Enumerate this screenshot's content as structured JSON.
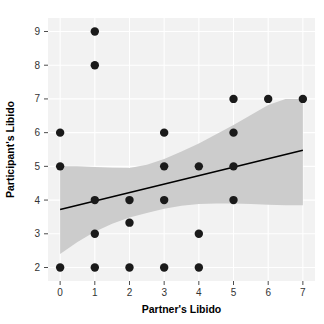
{
  "chart_data": {
    "type": "scatter",
    "title": "",
    "xlabel": "Partner's Libido",
    "ylabel": "Participant's Libido",
    "xlim": [
      -0.35,
      7.35
    ],
    "ylim": [
      1.6,
      9.4
    ],
    "xticks": [
      0,
      1,
      2,
      3,
      4,
      5,
      6,
      7
    ],
    "xticklabels": [
      "0",
      "1",
      "2",
      "3",
      "4",
      "5",
      "6",
      "7"
    ],
    "yticks": [
      2,
      3,
      4,
      5,
      6,
      7,
      8,
      9
    ],
    "yticklabels": [
      "2",
      "3",
      "4",
      "5",
      "6",
      "7",
      "8",
      "9"
    ],
    "grid": true,
    "legend": "none",
    "points": [
      {
        "x": 0,
        "y": 6
      },
      {
        "x": 0,
        "y": 5
      },
      {
        "x": 0,
        "y": 2
      },
      {
        "x": 1,
        "y": 9
      },
      {
        "x": 1,
        "y": 8
      },
      {
        "x": 1,
        "y": 4
      },
      {
        "x": 1,
        "y": 3
      },
      {
        "x": 1,
        "y": 2
      },
      {
        "x": 2,
        "y": 4
      },
      {
        "x": 2,
        "y": 3.33
      },
      {
        "x": 2,
        "y": 2
      },
      {
        "x": 3,
        "y": 6
      },
      {
        "x": 3,
        "y": 5
      },
      {
        "x": 3,
        "y": 4
      },
      {
        "x": 3,
        "y": 2
      },
      {
        "x": 4,
        "y": 5
      },
      {
        "x": 4,
        "y": 3
      },
      {
        "x": 4,
        "y": 2
      },
      {
        "x": 5,
        "y": 7
      },
      {
        "x": 5,
        "y": 6
      },
      {
        "x": 5,
        "y": 5
      },
      {
        "x": 5,
        "y": 4
      },
      {
        "x": 6,
        "y": 7
      },
      {
        "x": 7,
        "y": 7
      }
    ],
    "regression_line": {
      "x": [
        0,
        7
      ],
      "y": [
        3.72,
        5.48
      ]
    },
    "confidence_band": {
      "x": [
        0,
        0.5,
        1.0,
        1.5,
        2.0,
        2.5,
        3.0,
        3.5,
        4.0,
        4.5,
        5.0,
        5.5,
        6.0,
        6.5,
        7.0
      ],
      "upper": [
        5.0,
        5.0,
        4.98,
        4.96,
        4.95,
        5.05,
        5.22,
        5.44,
        5.68,
        5.95,
        6.23,
        6.52,
        6.82,
        7.0,
        7.0
      ],
      "lower": [
        2.4,
        2.76,
        3.06,
        3.3,
        3.48,
        3.62,
        3.74,
        3.83,
        3.88,
        3.9,
        3.9,
        3.88,
        3.86,
        3.85,
        3.85
      ]
    },
    "colors": {
      "panel_background": "#f2f2f2",
      "grid_line": "#ffffff",
      "point": "#1a1a1a",
      "regression_line": "#000000",
      "confidence_band": "#cccccc",
      "tick_mark": "#4d4d4d",
      "axis_text": "#333333",
      "axis_title": "#000000",
      "figure_background": "#ffffff"
    },
    "point_radius": 4.2,
    "line_width": 1.6
  }
}
